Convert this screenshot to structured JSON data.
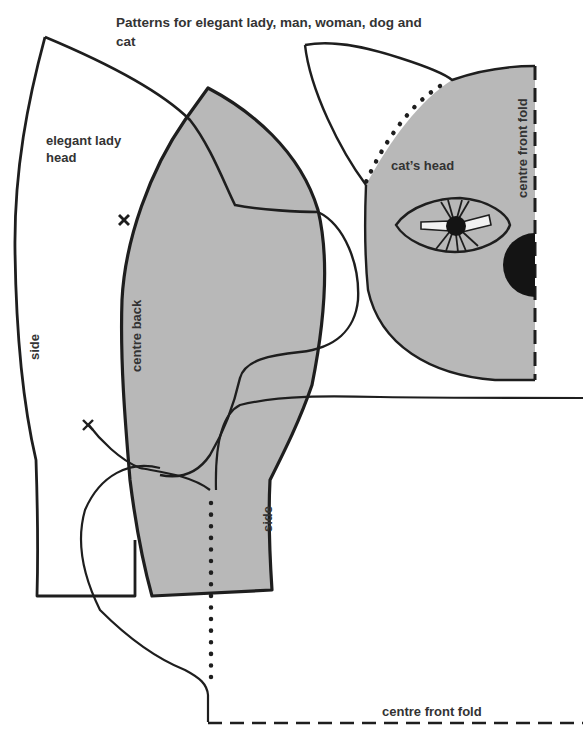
{
  "page": {
    "title": "Patterns for elegant lady, man, woman, dog and cat"
  },
  "pattern_pieces": {
    "elegant_lady_head": {
      "label_line1": "elegant lady",
      "label_line2": "head",
      "side_label": "side"
    },
    "centre_back_piece": {
      "centre_back_label": "centre back",
      "side_label": "side"
    },
    "cats_head": {
      "label": "cat’s head",
      "fold_label": "centre front fold"
    },
    "bottom_piece": {
      "fold_label": "centre front fold"
    }
  },
  "colors": {
    "fill_gray": "#b8b8b8",
    "line": "#1e1e1e",
    "background": "#ffffff"
  }
}
